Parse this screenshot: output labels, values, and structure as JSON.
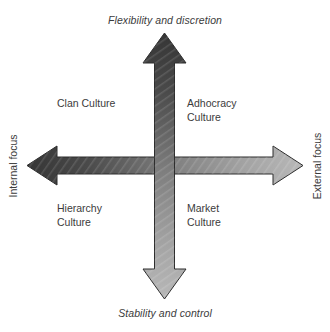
{
  "diagram": {
    "axes": {
      "top": {
        "text": "Flexibility and discretion",
        "name": "flexibility-and-discretion"
      },
      "bottom": {
        "text": "Stability and control",
        "name": "stability-and-control"
      },
      "left": {
        "text": "Internal focus",
        "name": "internal-focus"
      },
      "right": {
        "text": "External focus",
        "name": "external-focus"
      }
    },
    "quadrants": [
      {
        "id": "clan",
        "text": "Clan Culture",
        "position": "top-left"
      },
      {
        "id": "adhocracy",
        "text": "Adhocracy\nCulture",
        "position": "top-right"
      },
      {
        "id": "hierarchy",
        "text": "Hierarchy\nCulture",
        "position": "bottom-left"
      },
      {
        "id": "market",
        "text": "Market\nCulture",
        "position": "bottom-right"
      }
    ],
    "arrows": [
      {
        "id": "vertical-arrow",
        "name": "vertical-double-arrow",
        "orientation": "vertical",
        "double_headed": true,
        "gradient_from": "#3a3a3a",
        "gradient_to": "#b5b5b5"
      },
      {
        "id": "horizontal-arrow",
        "name": "horizontal-double-arrow",
        "orientation": "horizontal",
        "double_headed": true,
        "gradient_from": "#3a3a3a",
        "gradient_to": "#b5b5b5"
      }
    ],
    "colors": {
      "background": "#ffffff",
      "text": "#3b3b3b",
      "arrow_dark": "#3a3a3a",
      "arrow_light": "#b5b5b5",
      "arrow_outline": "#2d2d2d"
    }
  }
}
